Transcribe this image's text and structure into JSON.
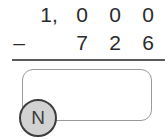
{
  "problem": {
    "operator": "–",
    "minuend": {
      "thousands": "1,",
      "hundreds": "0",
      "tens": "0",
      "ones": "0"
    },
    "subtrahend": {
      "thousands": "",
      "hundreds": "7",
      "tens": "2",
      "ones": "6"
    }
  },
  "answer": {
    "value": "",
    "placeholder": ""
  },
  "badge": {
    "label": "N"
  },
  "colors": {
    "ink": "#2b2b2b",
    "rule": "#5a5a5a",
    "box_border": "#9a9a9a",
    "badge_fill": "#d2d2d2",
    "badge_border": "#3d3d3d",
    "background": "#ffffff"
  }
}
